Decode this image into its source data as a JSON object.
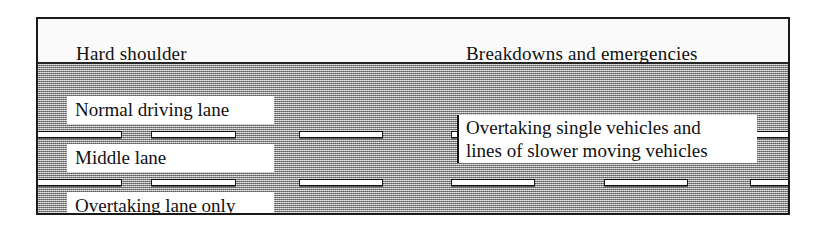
{
  "diagram": {
    "frame_color": "#1a1a1a",
    "road_color": "#a9a9a9",
    "shoulder_color": "#fafafa",
    "label_plate_color": "#ffffff",
    "text_color": "#111111"
  },
  "shoulder": {
    "lane_label": "Hard shoulder",
    "usage_label": "Breakdowns and emergencies"
  },
  "lanes": [
    {
      "name": "Normal driving lane"
    },
    {
      "name": "Middle lane"
    },
    {
      "name": "Overtaking lane only"
    }
  ],
  "overtaking_note": {
    "line1": "Overtaking single vehicles and",
    "line2": "lines of slower moving vehicles"
  },
  "lane_markings": {
    "description": "white dashed lane divider segments",
    "row1_y": 67,
    "row2_y": 115,
    "segments_row1": [
      {
        "x": -8,
        "w": 92
      },
      {
        "x": 113,
        "w": 85
      },
      {
        "x": 261,
        "w": 84
      },
      {
        "x": 413,
        "w": 84
      },
      {
        "x": 566,
        "w": 84
      },
      {
        "x": 712,
        "w": 60
      }
    ],
    "segments_row2": [
      {
        "x": -8,
        "w": 92
      },
      {
        "x": 113,
        "w": 85
      },
      {
        "x": 261,
        "w": 84
      },
      {
        "x": 413,
        "w": 84
      },
      {
        "x": 566,
        "w": 84
      },
      {
        "x": 712,
        "w": 60
      }
    ]
  }
}
